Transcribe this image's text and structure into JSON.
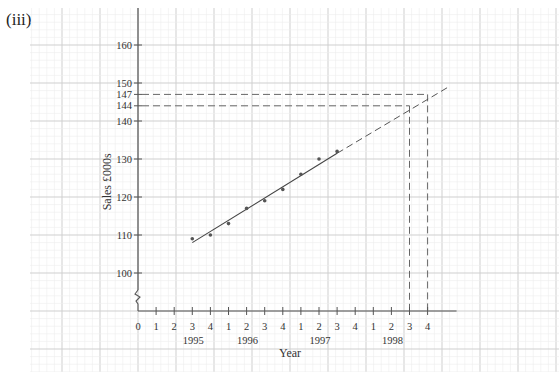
{
  "part_label": "(iii)",
  "chart_data": {
    "type": "scatter",
    "title": "",
    "xlabel": "Year",
    "ylabel": "Sales £000s",
    "grid": true,
    "y_break": true,
    "ylim": [
      95,
      165
    ],
    "y_ticks": [
      100,
      110,
      120,
      130,
      140,
      144,
      147,
      150,
      160
    ],
    "x_tick_labels": [
      "0",
      "1",
      "2",
      "3",
      "4",
      "1",
      "2",
      "3",
      "4",
      "1",
      "2",
      "3",
      "4",
      "1",
      "2",
      "3",
      "4"
    ],
    "x_year_labels": [
      {
        "label": "1995",
        "index": 3
      },
      {
        "label": "1996",
        "index": 6
      },
      {
        "label": "1997",
        "index": 10
      },
      {
        "label": "1998",
        "index": 14
      }
    ],
    "categories": [
      "1995 Q3",
      "1995 Q4",
      "1996 Q1",
      "1996 Q2",
      "1996 Q3",
      "1996 Q4",
      "1997 Q1",
      "1997 Q2",
      "1997 Q3"
    ],
    "x_index": [
      3,
      4,
      5,
      6,
      7,
      8,
      9,
      10,
      11
    ],
    "values": [
      109,
      110,
      113,
      117,
      119,
      122,
      126,
      130,
      132
    ],
    "trend_line": {
      "solid": {
        "from": [
          3,
          108
        ],
        "to": [
          11,
          131.5
        ]
      },
      "dashed_extension": {
        "from": [
          11,
          131.5
        ],
        "to": [
          17,
          149
        ]
      }
    },
    "predictions": [
      {
        "quarter": "1998 Q3",
        "x_index": 15,
        "value": 144
      },
      {
        "quarter": "1998 Q4",
        "x_index": 16,
        "value": 147
      }
    ]
  }
}
